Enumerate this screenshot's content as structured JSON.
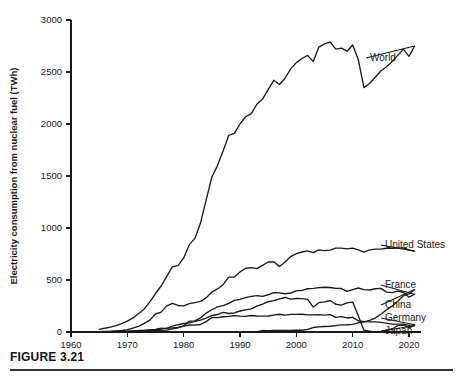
{
  "figure": {
    "caption": "FIGURE 3.21"
  },
  "chart_data": {
    "type": "line",
    "title": "",
    "xlabel": "",
    "ylabel": "Electricity consumption from nuclear fuel (TWh)",
    "xlim": [
      1960,
      2023
    ],
    "ylim": [
      0,
      3000
    ],
    "grid": false,
    "legend_position": "right-inline-labels",
    "xticks": [
      1960,
      1970,
      1980,
      1990,
      2000,
      2010,
      2020
    ],
    "yticks": [
      0,
      500,
      1000,
      1500,
      2000,
      2500,
      3000
    ],
    "x": [
      1965,
      1966,
      1967,
      1968,
      1969,
      1970,
      1971,
      1972,
      1973,
      1974,
      1975,
      1976,
      1977,
      1978,
      1979,
      1980,
      1981,
      1982,
      1983,
      1984,
      1985,
      1986,
      1987,
      1988,
      1989,
      1990,
      1991,
      1992,
      1993,
      1994,
      1995,
      1996,
      1997,
      1998,
      1999,
      2000,
      2001,
      2002,
      2003,
      2004,
      2005,
      2006,
      2007,
      2008,
      2009,
      2010,
      2011,
      2012,
      2013,
      2014,
      2015,
      2016,
      2017,
      2018,
      2019,
      2020,
      2021
    ],
    "series": [
      {
        "name": "World",
        "label": "World",
        "values": [
          26,
          36,
          47,
          62,
          81,
          105,
          135,
          177,
          222,
          290,
          370,
          442,
          534,
          628,
          639,
          712,
          840,
          900,
          1050,
          1270,
          1490,
          1600,
          1740,
          1890,
          1910,
          2000,
          2070,
          2100,
          2190,
          2240,
          2330,
          2420,
          2380,
          2440,
          2530,
          2590,
          2630,
          2660,
          2600,
          2740,
          2770,
          2790,
          2720,
          2730,
          2700,
          2760,
          2620,
          2350,
          2390,
          2450,
          2510,
          2550,
          2600,
          2660,
          2720,
          2650,
          2750
        ]
      },
      {
        "name": "United States",
        "label": "United States",
        "values": [
          3,
          5,
          7,
          11,
          14,
          22,
          38,
          54,
          83,
          114,
          173,
          191,
          251,
          276,
          255,
          251,
          273,
          283,
          294,
          328,
          384,
          414,
          455,
          527,
          529,
          577,
          613,
          619,
          610,
          640,
          673,
          675,
          629,
          674,
          725,
          754,
          769,
          780,
          764,
          789,
          782,
          787,
          806,
          806,
          799,
          807,
          790,
          769,
          789,
          797,
          797,
          805,
          805,
          807,
          809,
          790,
          778
        ]
      },
      {
        "name": "France",
        "label": "France",
        "values": [
          1,
          2,
          3,
          3,
          4,
          5,
          9,
          14,
          14,
          14,
          18,
          16,
          18,
          30,
          40,
          58,
          105,
          107,
          135,
          182,
          214,
          241,
          253,
          275,
          304,
          314,
          331,
          342,
          350,
          342,
          358,
          378,
          376,
          368,
          375,
          395,
          401,
          416,
          420,
          426,
          430,
          428,
          420,
          418,
          390,
          408,
          423,
          407,
          404,
          416,
          419,
          384,
          379,
          393,
          382,
          335,
          363
        ]
      },
      {
        "name": "China",
        "label": "China",
        "values": [
          0,
          0,
          0,
          0,
          0,
          0,
          0,
          0,
          0,
          0,
          0,
          0,
          0,
          0,
          0,
          0,
          0,
          0,
          0,
          0,
          0,
          0,
          0,
          0,
          0,
          0,
          0,
          1,
          3,
          14,
          13,
          14,
          14,
          14,
          15,
          17,
          17,
          25,
          43,
          50,
          53,
          55,
          62,
          68,
          70,
          74,
          87,
          98,
          111,
          133,
          171,
          213,
          248,
          295,
          348,
          366,
          408
        ]
      },
      {
        "name": "Germany",
        "label": "Germany",
        "values": [
          2,
          3,
          4,
          5,
          6,
          7,
          9,
          13,
          14,
          18,
          22,
          28,
          37,
          39,
          45,
          56,
          67,
          66,
          72,
          100,
          139,
          138,
          147,
          151,
          158,
          153,
          150,
          159,
          154,
          152,
          154,
          162,
          171,
          162,
          170,
          170,
          171,
          165,
          165,
          167,
          163,
          167,
          141,
          148,
          135,
          141,
          108,
          99,
          97,
          97,
          92,
          85,
          76,
          76,
          75,
          64,
          69
        ]
      },
      {
        "name": "Japan",
        "label": "Japan",
        "values": [
          1,
          1,
          2,
          3,
          4,
          5,
          8,
          12,
          10,
          20,
          26,
          37,
          32,
          56,
          70,
          82,
          88,
          102,
          114,
          134,
          159,
          168,
          188,
          178,
          183,
          202,
          213,
          223,
          249,
          269,
          291,
          302,
          319,
          332,
          316,
          322,
          321,
          313,
          240,
          282,
          290,
          303,
          267,
          258,
          280,
          288,
          156,
          17,
          9,
          0,
          4,
          17,
          29,
          62,
          66,
          43,
          61
        ]
      }
    ],
    "annotations": [
      {
        "text": "World",
        "series": "World",
        "x": 370,
        "y": 58
      },
      {
        "text": "United States",
        "series": "United States",
        "x": 385,
        "y": 245
      },
      {
        "text": "France",
        "series": "France",
        "x": 385,
        "y": 285
      },
      {
        "text": "China",
        "series": "China",
        "x": 385,
        "y": 305
      },
      {
        "text": "Germany",
        "series": "Germany",
        "x": 385,
        "y": 318
      },
      {
        "text": "Japan",
        "series": "Japan",
        "x": 385,
        "y": 331
      }
    ]
  }
}
